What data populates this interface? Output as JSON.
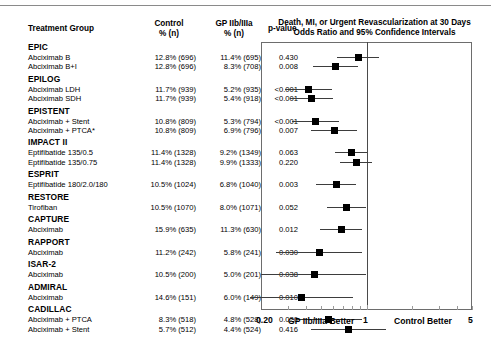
{
  "columns": {
    "treatment": "Treatment Group",
    "control_l1": "Control",
    "control_l2": "% (n)",
    "gp_l1": "GP IIb/IIIa",
    "gp_l2": "% (n)",
    "pvalue": "p-value"
  },
  "plot": {
    "title_l1": "Death, MI, or Urgent Revascularization at 30 Days",
    "title_l2": "Odds Ratio and 95% Confidence Intervals",
    "axis_min_label": "0.20",
    "axis_null_label": "1",
    "axis_max_label": "5",
    "left_favor_label": "GP IIb/IIIa Better",
    "right_favor_label": "Control Better",
    "marker_color": "#000000",
    "line_color": "#3d3d3d"
  },
  "chart_data": {
    "type": "forest",
    "xlabel": "Odds Ratio",
    "xscale": "log",
    "xlim": [
      0.2,
      5
    ],
    "xticks": [
      0.2,
      1,
      5
    ],
    "null_value": 1,
    "grid": false,
    "left_favor_label": "GP IIb/IIIa Better",
    "right_favor_label": "Control Better",
    "columns": [
      "Treatment Group",
      "Control % (n)",
      "GP IIb/IIIa % (n)",
      "p-value"
    ],
    "groups": [
      {
        "trial": "EPIC",
        "rows": [
          {
            "arm": "Abciximab B",
            "control": "12.8% (696)",
            "gp": "11.4% (695)",
            "p": "0.430",
            "or": 0.88,
            "ci_low": 0.64,
            "ci_high": 1.21
          },
          {
            "arm": "Abciximab B+I",
            "control": "12.8% (696)",
            "gp": "8.3% (708)",
            "p": "0.008",
            "or": 0.62,
            "ci_low": 0.44,
            "ci_high": 0.88
          }
        ]
      },
      {
        "trial": "EPILOG",
        "rows": [
          {
            "arm": "Abciximab LDH",
            "control": "11.7% (939)",
            "gp": "5.2% (935)",
            "p": "<0.001",
            "or": 0.41,
            "ci_low": 0.29,
            "ci_high": 0.59
          },
          {
            "arm": "Abciximab SDH",
            "control": "11.7% (939)",
            "gp": "5.4% (918)",
            "p": "<0.001",
            "or": 0.43,
            "ci_low": 0.31,
            "ci_high": 0.6
          }
        ]
      },
      {
        "trial": "EPISTENT",
        "rows": [
          {
            "arm": "Abciximab + Stent",
            "control": "10.8% (809)",
            "gp": "5.3% (794)",
            "p": "<0.001",
            "or": 0.46,
            "ci_low": 0.32,
            "ci_high": 0.66
          },
          {
            "arm": "Abciximab + PTCA*",
            "control": "10.8% (809)",
            "gp": "6.9% (796)",
            "p": "0.007",
            "or": 0.61,
            "ci_low": 0.43,
            "ci_high": 0.86
          }
        ]
      },
      {
        "trial": "IMPACT II",
        "rows": [
          {
            "arm": "Eptifibatide 135/0.5",
            "control": "11.4% (1328)",
            "gp": "9.2% (1349)",
            "p": "0.063",
            "or": 0.79,
            "ci_low": 0.62,
            "ci_high": 1.01
          },
          {
            "arm": "Eptifibatide 135/0.75",
            "control": "11.4% (1328)",
            "gp": "9.9% (1333)",
            "p": "0.220",
            "or": 0.86,
            "ci_low": 0.67,
            "ci_high": 1.09
          }
        ]
      },
      {
        "trial": "ESPRIT",
        "rows": [
          {
            "arm": "Eptifibatide 180/2.0/180",
            "control": "10.5% (1024)",
            "gp": "6.8% (1040)",
            "p": "0.003",
            "or": 0.63,
            "ci_low": 0.46,
            "ci_high": 0.85
          }
        ]
      },
      {
        "trial": "RESTORE",
        "rows": [
          {
            "arm": "Tirofiban",
            "control": "10.5% (1070)",
            "gp": "8.0% (1071)",
            "p": "0.052",
            "or": 0.74,
            "ci_low": 0.55,
            "ci_high": 1.0
          }
        ]
      },
      {
        "trial": "CAPTURE",
        "rows": [
          {
            "arm": "Abciximab",
            "control": "15.9% (635)",
            "gp": "11.3% (630)",
            "p": "0.012",
            "or": 0.68,
            "ci_low": 0.49,
            "ci_high": 0.93
          }
        ]
      },
      {
        "trial": "RAPPORT",
        "rows": [
          {
            "arm": "Abciximab",
            "control": "11.2% (242)",
            "gp": "5.8% (241)",
            "p": "0.030",
            "or": 0.49,
            "ci_low": 0.25,
            "ci_high": 0.94
          }
        ]
      },
      {
        "trial": "ISAR-2",
        "rows": [
          {
            "arm": "Abciximab",
            "control": "10.5% (200)",
            "gp": "5.0% (201)",
            "p": "0.038",
            "or": 0.45,
            "ci_low": 0.2,
            "ci_high": 0.99
          }
        ]
      },
      {
        "trial": "ADMIRAL",
        "rows": [
          {
            "arm": "Abciximab",
            "control": "14.6% (151)",
            "gp": "6.0% (149)",
            "p": "0.010",
            "or": 0.37,
            "ci_low": 0.17,
            "ci_high": 0.81
          }
        ]
      },
      {
        "trial": "CADILLAC",
        "rows": [
          {
            "arm": "Abciximab + PTCA",
            "control": "8.3% (518)",
            "gp": "4.8% (528)",
            "p": "0.020",
            "or": 0.56,
            "ci_low": 0.34,
            "ci_high": 0.93
          },
          {
            "arm": "Abciximab + Stent",
            "control": "5.7% (512)",
            "gp": "4.4% (524)",
            "p": "0.416",
            "or": 0.76,
            "ci_low": 0.43,
            "ci_high": 1.35
          }
        ]
      }
    ]
  }
}
